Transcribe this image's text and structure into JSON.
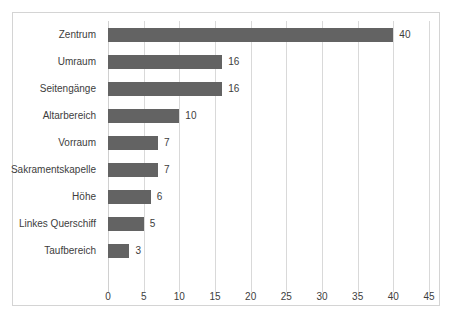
{
  "chart_data": {
    "type": "bar",
    "orientation": "horizontal",
    "title": "",
    "subtitle": "",
    "xlabel": "",
    "ylabel": "",
    "categories": [
      "Zentrum",
      "Umraum",
      "Seitengänge",
      "Altarbereich",
      "Vorraum",
      "Sakramentskapelle",
      "Höhe",
      "Linkes Querschiff",
      "Taufbereich"
    ],
    "values": [
      40,
      16,
      16,
      10,
      7,
      7,
      6,
      5,
      3
    ],
    "data_labels": [
      "40",
      "16",
      "16",
      "10",
      "7",
      "7",
      "6",
      "5",
      "3"
    ],
    "xlim": [
      0,
      45
    ],
    "xticks": [
      0,
      5,
      10,
      15,
      20,
      25,
      30,
      35,
      40,
      45
    ],
    "xtick_labels": [
      "0",
      "5",
      "10",
      "15",
      "20",
      "25",
      "30",
      "35",
      "40",
      "45"
    ],
    "grid": "vertical",
    "legend": null,
    "bar_color": "#636363",
    "gridline_color": "#d9d9d9",
    "text_color": "#3d3d3d",
    "background_color": "#ffffff",
    "border_color": "#d4d4d4"
  }
}
